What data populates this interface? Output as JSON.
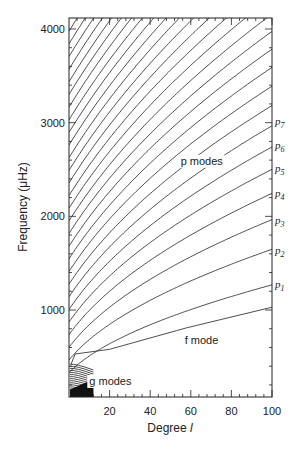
{
  "chart_data": {
    "type": "line",
    "title": "",
    "xlabel": "Degree l",
    "xlabel_prefix": "Degree ",
    "xlabel_var": "l",
    "ylabel": "Frequency (μHz)",
    "xlim": [
      0,
      100
    ],
    "ylim": [
      0,
      4100
    ],
    "x_ticks": [
      20,
      40,
      60,
      80,
      100
    ],
    "y_ticks": [
      1000,
      2000,
      3000,
      4000
    ],
    "grid": false,
    "legend": null,
    "annotations": [
      {
        "text": "p modes",
        "x": 55,
        "y": 2550
      },
      {
        "text": "f mode",
        "x": 57,
        "y": 640
      },
      {
        "text": "g modes",
        "x": 10,
        "y": 200
      }
    ],
    "right_labels": [
      {
        "text": "p",
        "sub": "1",
        "y": 1280
      },
      {
        "text": "p",
        "sub": "2",
        "y": 1640
      },
      {
        "text": "p",
        "sub": "3",
        "y": 1960
      },
      {
        "text": "p",
        "sub": "4",
        "y": 2250
      },
      {
        "text": "p",
        "sub": "5",
        "y": 2520
      },
      {
        "text": "p",
        "sub": "6",
        "y": 2760
      },
      {
        "text": "p",
        "sub": "7",
        "y": 3020
      }
    ],
    "series": [
      {
        "name": "f mode",
        "x": [
          1,
          3,
          20,
          53,
          58,
          100
        ],
        "y": [
          420,
          530,
          580,
          780,
          810,
          1030
        ]
      },
      {
        "name": "p1",
        "x": [
          100
        ],
        "y": [
          1299
        ]
      },
      {
        "name": "p2",
        "x": [
          100
        ],
        "y": [
          1640
        ]
      },
      {
        "name": "p3",
        "x": [
          100
        ],
        "y": [
          1932
        ]
      },
      {
        "name": "p4",
        "x": [
          100
        ],
        "y": [
          2200
        ]
      },
      {
        "name": "p5",
        "x": [
          100
        ],
        "y": [
          2466
        ]
      },
      {
        "name": "p6",
        "x": [
          100
        ],
        "y": [
          2700
        ]
      },
      {
        "name": "p7",
        "x": [
          100
        ],
        "y": [
          2964
        ]
      }
    ],
    "p_mode_model": {
      "dnu": 135,
      "offset": 1.45,
      "k": 10000,
      "n_max": 40
    },
    "g_mode_count": 14
  }
}
